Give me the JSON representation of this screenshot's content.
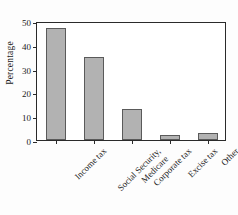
{
  "chart_data": {
    "type": "bar",
    "title": "",
    "xlabel": "",
    "ylabel": "Percentage",
    "categories": [
      "Income tax",
      "Social Security, Medicare",
      "Corporate tax",
      "Excise tax",
      "Other"
    ],
    "category_lines": [
      [
        "Income tax"
      ],
      [
        "Social Security,",
        "Medicare"
      ],
      [
        "Corporate tax"
      ],
      [
        "Excise tax"
      ],
      [
        "Other"
      ]
    ],
    "values": [
      47,
      35,
      13,
      2,
      3
    ],
    "ylim": [
      0,
      50
    ],
    "yticks": [
      0,
      10,
      20,
      30,
      40,
      50
    ],
    "ytick_labels": [
      "0",
      "10",
      "20",
      "30",
      "40",
      "50"
    ],
    "grid": false,
    "legend": false,
    "bar_color": "#b2b2b2",
    "bar_edge_color": "#5a5a5a",
    "axis_color": "#2a2a2a",
    "background": "#ffffff"
  }
}
